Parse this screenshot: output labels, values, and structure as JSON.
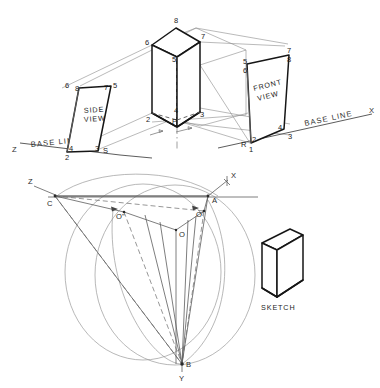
{
  "drawing": {
    "title": "Axonometric projection construction plate",
    "background_color": "#ffffff",
    "ink_color": "#161616",
    "construction_color": "#8c8c8c",
    "width": 380,
    "height": 388
  },
  "views": {
    "side_view": {
      "caption_line1": "SIDE",
      "caption_line2": "VIEW",
      "corner_labels": [
        "6",
        "8",
        "7",
        "5",
        "4",
        "3",
        "2",
        "S"
      ]
    },
    "front_view": {
      "caption_line1": "FRONT",
      "caption_line2": "VIEW",
      "corner_labels": [
        "5",
        "6",
        "8",
        "7",
        "4",
        "3",
        "2",
        "1",
        "R"
      ]
    },
    "pictorial": {
      "corner_labels": [
        "8",
        "6",
        "7",
        "5",
        "2",
        "3",
        "4",
        "P"
      ]
    },
    "sketch": {
      "caption": "SKETCH"
    }
  },
  "base_lines": {
    "left_axis_label": "Z",
    "left_text": "BASE LINE",
    "right_text": "BASE LINE",
    "right_axis_label": "X"
  },
  "axonometric": {
    "axis_labels": {
      "z": "Z",
      "x": "X",
      "y": "Y"
    },
    "vertices": {
      "a": "A",
      "b": "B",
      "c": "C",
      "o": "O",
      "o_prime": "O'",
      "o_double_prime": "O''"
    }
  }
}
